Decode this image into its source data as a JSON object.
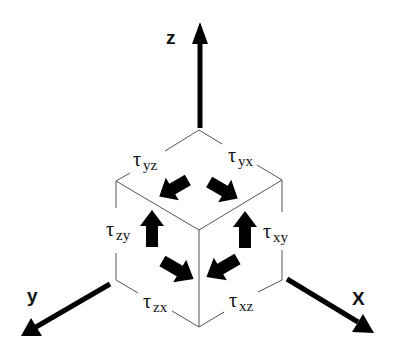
{
  "diagram": {
    "axes": {
      "z": {
        "label": "z"
      },
      "y": {
        "label": "y"
      },
      "x": {
        "label": "X"
      }
    },
    "stress_labels": [
      {
        "symbol": "τ",
        "subscript": "yz",
        "position": "top-left face"
      },
      {
        "symbol": "τ",
        "subscript": "yx",
        "position": "top-right face"
      },
      {
        "symbol": "τ",
        "subscript": "zy",
        "position": "left face"
      },
      {
        "symbol": "τ",
        "subscript": "xy",
        "position": "right face"
      },
      {
        "symbol": "τ",
        "subscript": "zx",
        "position": "bottom-left edge"
      },
      {
        "symbol": "τ",
        "subscript": "xz",
        "position": "bottom-right edge"
      }
    ],
    "arrows": [
      {
        "name": "shear-arrow-yz",
        "direction": "down-left"
      },
      {
        "name": "shear-arrow-yx",
        "direction": "down-right"
      },
      {
        "name": "shear-arrow-zy",
        "direction": "up"
      },
      {
        "name": "shear-arrow-xy",
        "direction": "up"
      },
      {
        "name": "shear-arrow-zx",
        "direction": "down-right"
      },
      {
        "name": "shear-arrow-xz",
        "direction": "down-left"
      }
    ],
    "colors": {
      "ink": "#000000",
      "edge": "#555555",
      "background": "#ffffff"
    }
  }
}
